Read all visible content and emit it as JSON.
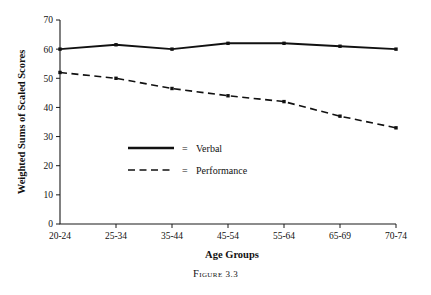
{
  "figure": {
    "caption_word": "Figure",
    "caption_number": "3.3"
  },
  "chart_data": {
    "type": "line",
    "title": "",
    "xlabel": "Age Groups",
    "ylabel": "Weighted Sums of Scaled Scores",
    "categories": [
      "20-24",
      "25-34",
      "35-44",
      "45-54",
      "55-64",
      "65-69",
      "70-74"
    ],
    "ylim": [
      0,
      70
    ],
    "yticks": [
      0,
      10,
      20,
      30,
      40,
      50,
      60,
      70
    ],
    "ytick_labels": [
      "0",
      "10",
      "20",
      "30",
      "40",
      "50",
      "60",
      "70"
    ],
    "grid": false,
    "legend_position": "center-left",
    "series": [
      {
        "name": "Verbal",
        "style": "solid",
        "values": [
          60,
          61.5,
          60,
          62,
          62,
          61,
          60
        ]
      },
      {
        "name": "Performance",
        "style": "dashed",
        "values": [
          52,
          50,
          46.5,
          44,
          42,
          37,
          33
        ]
      }
    ],
    "legend": [
      {
        "equals": "=",
        "label": "Verbal",
        "style": "solid"
      },
      {
        "equals": "=",
        "label": "Performance",
        "style": "dashed"
      }
    ]
  }
}
